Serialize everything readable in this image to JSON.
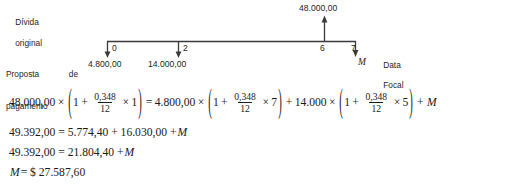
{
  "diagram": {
    "left_labels": {
      "debt_line1": "Dívida",
      "debt_line2": "original",
      "proposal_line1": "Proposta de",
      "proposal_line2": "pagamento"
    },
    "focal_label": {
      "line1": "Data",
      "line2": "Focal"
    },
    "focal_symbol": "M",
    "top_amount": "48.000,00",
    "ticks": [
      {
        "period": "0",
        "amount": "4.800,00",
        "direction": "down"
      },
      {
        "period": "2",
        "amount": "14.000,00",
        "direction": "down"
      },
      {
        "period": "6",
        "amount": "",
        "direction": "up"
      },
      {
        "period": "7",
        "amount": "",
        "direction": "down"
      }
    ]
  },
  "equations": {
    "line1": {
      "lhs_value": "48.000,00",
      "times": "×",
      "open_paren": "(",
      "one": "1",
      "plus": "+",
      "frac_num": "0,348",
      "frac_den": "12",
      "factor_a": "1",
      "close_paren": ")",
      "equals": "=",
      "rhs_value": "4.800,00",
      "factor_b": "7",
      "term3_value": "14.000",
      "factor_c": "5",
      "unknown": "M"
    },
    "line2": "49.392,00 = 5.774,40 + 16.030,00 + ",
    "line2_var": "M",
    "line3": "49.392,00 = 21.804,40 + ",
    "line3_var": "M",
    "line4_var": "M",
    "line4": " = $ 27.587,60"
  },
  "colors": {
    "ink": "#1a1a1a",
    "label_ink": "#231f20",
    "axis": "#3a3a3a",
    "background": "#ffffff"
  }
}
